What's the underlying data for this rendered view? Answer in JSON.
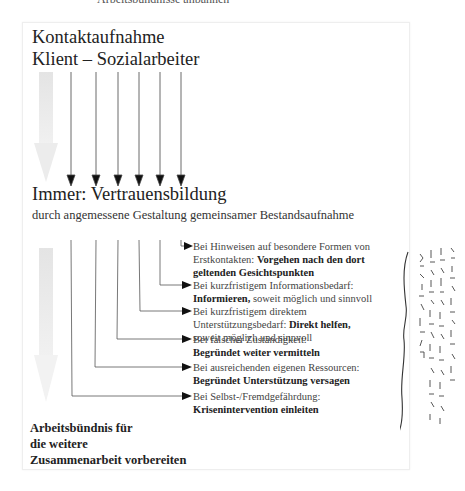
{
  "caption": "Arbeitsbündnisse anbahnen",
  "diagram": {
    "title_line1": "Kontaktaufnahme",
    "title_line2": "Klient – Sozialarbeiter",
    "center_heading": "Immer: Vertrauensbildung",
    "center_subheading": "durch angemessene Gestaltung gemeinsamer Bestandsaufnahme",
    "branches": [
      {
        "condition": "Bei Hinweisen auf besondere Formen von Erstkontakten:",
        "action": "Vorgehen nach den dort geltenden Gesichtspunkten",
        "suffix": ""
      },
      {
        "condition": "Bei kurzfristigem Informationsbedarf:",
        "action": "Informieren,",
        "suffix": "soweit möglich und sinnvoll"
      },
      {
        "condition": "Bei kurzfristigem direktem Unterstützungsbedarf:",
        "action": "Direkt helfen,",
        "suffix": "soweit möglich und sinnvoll"
      },
      {
        "condition": "Bei falscher Zuständigkeit:",
        "action": "Begründet weiter vermitteln",
        "suffix": ""
      },
      {
        "condition": "Bei ausreichenden eigenen Ressourcen:",
        "action": "Begründet Unterstützung versagen",
        "suffix": ""
      },
      {
        "condition": "Bei Selbst-/Fremdgefährdung:",
        "action": "Krisenintervention einleiten",
        "suffix": ""
      }
    ],
    "outcome_line1": "Arbeitsbündnis für",
    "outcome_line2": "die weitere",
    "outcome_line3": "Zusammenarbeit vorbereiten"
  },
  "handwritten_note": "VERTRAUENSBILDUNG, DIE EIN ARBEITSBÜNDNIS ZWISCHEN KLIENT + SOZIALARBEITER MÖGLICH MACHEN."
}
